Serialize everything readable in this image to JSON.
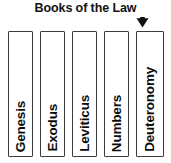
{
  "diagram": {
    "title": "Books of the Law",
    "pointer": {
      "icon": "arrow-down-icon",
      "direction": "down"
    },
    "books": [
      {
        "label": "Genesis"
      },
      {
        "label": "Exodus"
      },
      {
        "label": "Leviticus"
      },
      {
        "label": "Numbers"
      },
      {
        "label": "Deuteronomy"
      }
    ],
    "colors": {
      "background": "#ffffff",
      "box_fill": "#ffffff",
      "box_border": "#3b3b3b",
      "text": "#0a0a0a",
      "arrow": "#111111"
    }
  }
}
